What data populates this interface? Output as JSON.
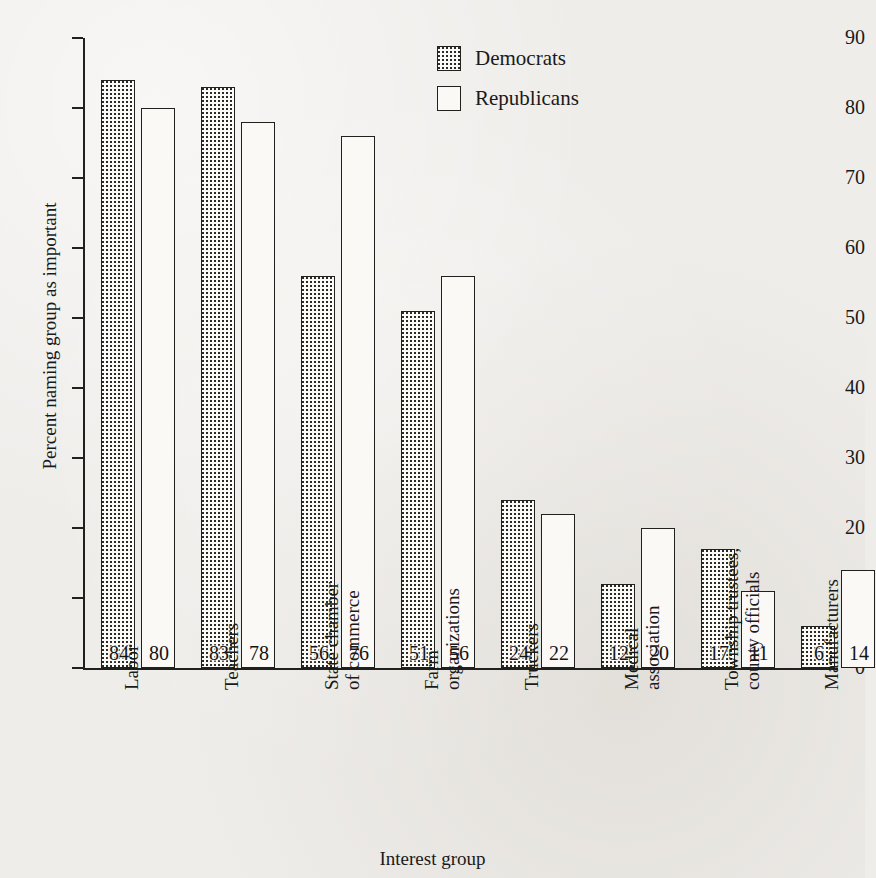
{
  "chart_data": {
    "type": "bar",
    "title": "",
    "xlabel": "Interest group",
    "ylabel": "Percent naming group as important",
    "ylim": [
      0,
      90
    ],
    "yticks": [
      0,
      10,
      20,
      30,
      40,
      50,
      60,
      70,
      80,
      90
    ],
    "grid": false,
    "legend_position": "top-center",
    "categories": [
      "Labor",
      "Teachers",
      "State chamber\nof commerce",
      "Farm\norganizations",
      "Truckers",
      "Medical\nassociation",
      "Township trustees,\ncounty officials",
      "Manufacturers"
    ],
    "series": [
      {
        "name": "Democrats",
        "values": [
          84,
          83,
          56,
          51,
          24,
          12,
          17,
          6
        ]
      },
      {
        "name": "Republicans",
        "values": [
          80,
          78,
          76,
          56,
          22,
          20,
          11,
          14
        ]
      }
    ]
  },
  "legend": {
    "items": [
      {
        "label": "Democrats"
      },
      {
        "label": "Republicans"
      }
    ]
  },
  "colors": {
    "ink": "#20201e",
    "paper": "#efedea",
    "bar_fill": "#faf9f6",
    "stipple_dot": "#2a2a28"
  }
}
